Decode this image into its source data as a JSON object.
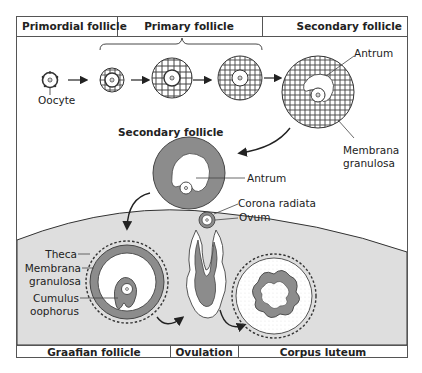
{
  "header": {
    "primordial": "Primordial follicle",
    "primary": "Primary follicle",
    "secondary": "Secondary follicle"
  },
  "footer": {
    "graafian": "Graafian follicle",
    "ovulation": "Ovulation",
    "corpus_luteum": "Corpus luteum"
  },
  "labels": {
    "oocyte": "Oocyte",
    "antrum_top": "Antrum",
    "membrana_line1": "Membrana",
    "membrana_line2": "granulosa",
    "secondary_follicle_mid": "Secondary follicle",
    "antrum_mid": "Antrum",
    "corona_radiata": "Corona radiata",
    "ovum": "Ovum",
    "theca": "Theca",
    "graafian_membrana_line1": "Membrana",
    "graafian_membrana_line2": "granulosa",
    "cumulus_line1": "Cumulus",
    "cumulus_line2": "oophorus"
  },
  "colors": {
    "tissue_gray": "#8c8c8c",
    "ovary_bg": "#dedede",
    "frame": "#555555",
    "text": "#222222"
  }
}
